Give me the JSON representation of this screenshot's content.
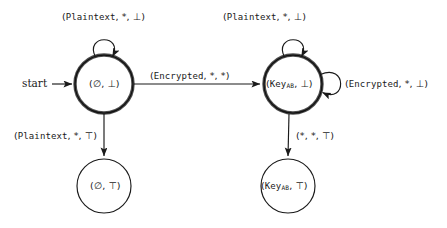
{
  "diagram": {
    "type": "finite-state-machine",
    "stroke_color": "#1a1a1a",
    "accent_color": "#6b6b6b",
    "background": "#ffffff",
    "start_marker": {
      "label": "start",
      "arrow": "→"
    },
    "states": [
      {
        "id": "empty-bottom",
        "text_prefix": "(∅, ⊥)",
        "kind": "initial-accepting",
        "ring": "double",
        "cx": 104,
        "cy": 84,
        "r": 29
      },
      {
        "id": "keyab-bottom",
        "text_prefix": "(Key",
        "subscript": "AB",
        "text_suffix": ", ⊥)",
        "kind": "accepting",
        "ring": "double",
        "cx": 293,
        "cy": 84,
        "r": 29
      },
      {
        "id": "empty-top",
        "text_prefix": "(∅, ⊤)",
        "kind": "normal",
        "ring": "single",
        "cx": 104,
        "cy": 186,
        "r": 27
      },
      {
        "id": "keyab-top",
        "text_prefix": "(Key",
        "subscript": "AB",
        "text_suffix": ", ⊤)",
        "kind": "normal",
        "ring": "single",
        "cx": 288,
        "cy": 186,
        "r": 27
      }
    ],
    "transitions": [
      {
        "id": "loop-empty-plaintext",
        "from": "empty-bottom",
        "to": "empty-bottom",
        "kind": "self-loop-top",
        "label_mono": "Plaintext",
        "label_full": "(Plaintext, *, ⊥)",
        "label_tail": ", *, ⊥)",
        "label_x": 62,
        "label_y": 12
      },
      {
        "id": "loop-keyab-plaintext",
        "from": "keyab-bottom",
        "to": "keyab-bottom",
        "kind": "self-loop-top",
        "label_mono": "Plaintext",
        "label_full": "(Plaintext, *, ⊥)",
        "label_tail": ", *, ⊥)",
        "label_x": 223,
        "label_y": 12
      },
      {
        "id": "encrypt-transition",
        "from": "empty-bottom",
        "to": "keyab-bottom",
        "kind": "horizontal",
        "label_mono": "Encrypted",
        "label_full": "(Encrypted, *, *)",
        "label_tail": ", *, *)",
        "label_x": 150,
        "label_y": 73
      },
      {
        "id": "loop-keyab-encrypted",
        "from": "keyab-bottom",
        "to": "keyab-bottom",
        "kind": "self-loop-right",
        "label_mono": "Encrypted",
        "label_full": "(Encrypted, *, ⊥)",
        "label_tail": ", *, ⊥)",
        "label_x": 345,
        "label_y": 81
      },
      {
        "id": "empty-to-top",
        "from": "empty-bottom",
        "to": "empty-top",
        "kind": "vertical",
        "label_mono": "Plaintext",
        "label_full": "(Plaintext, *, ⊤)",
        "label_tail": ", *, ⊤)",
        "label_x": 14,
        "label_y": 132
      },
      {
        "id": "keyab-to-top",
        "from": "keyab-bottom",
        "to": "keyab-top",
        "kind": "vertical",
        "label_mono": "",
        "label_full": "(*, *, ⊤)",
        "label_tail": "(*, *, ⊤)",
        "label_x": 296,
        "label_y": 132
      }
    ]
  }
}
